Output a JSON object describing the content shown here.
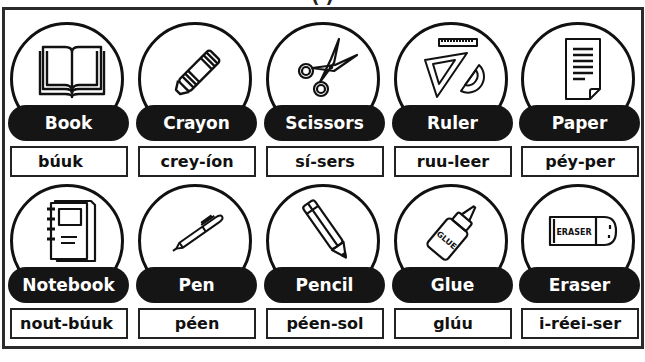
{
  "page": {
    "title_fragment": "(          )"
  },
  "cards": [
    {
      "word": "Book",
      "pronunciation": "búuk",
      "icon": "open-book-icon"
    },
    {
      "word": "Crayon",
      "pronunciation": "crey-íon",
      "icon": "crayon-icon"
    },
    {
      "word": "Scissors",
      "pronunciation": "sí-sers",
      "icon": "scissors-icon"
    },
    {
      "word": "Ruler",
      "pronunciation": "ruu-leer",
      "icon": "ruler-set-icon"
    },
    {
      "word": "Paper",
      "pronunciation": "péy-per",
      "icon": "paper-sheet-icon"
    },
    {
      "word": "Notebook",
      "pronunciation": "nout-búuk",
      "icon": "notebook-icon"
    },
    {
      "word": "Pen",
      "pronunciation": "péen",
      "icon": "pen-icon"
    },
    {
      "word": "Pencil",
      "pronunciation": "péen-sol",
      "icon": "pencil-icon"
    },
    {
      "word": "Glue",
      "pronunciation": "glúu",
      "icon": "glue-bottle-icon",
      "label_text": "GLUE"
    },
    {
      "word": "Eraser",
      "pronunciation": "i-réei-ser",
      "icon": "eraser-icon",
      "label_text": "ERASER"
    }
  ],
  "colors": {
    "pill_bg": "#151515",
    "pill_text": "#ffffff",
    "outline": "#111111",
    "background": "#ffffff"
  }
}
